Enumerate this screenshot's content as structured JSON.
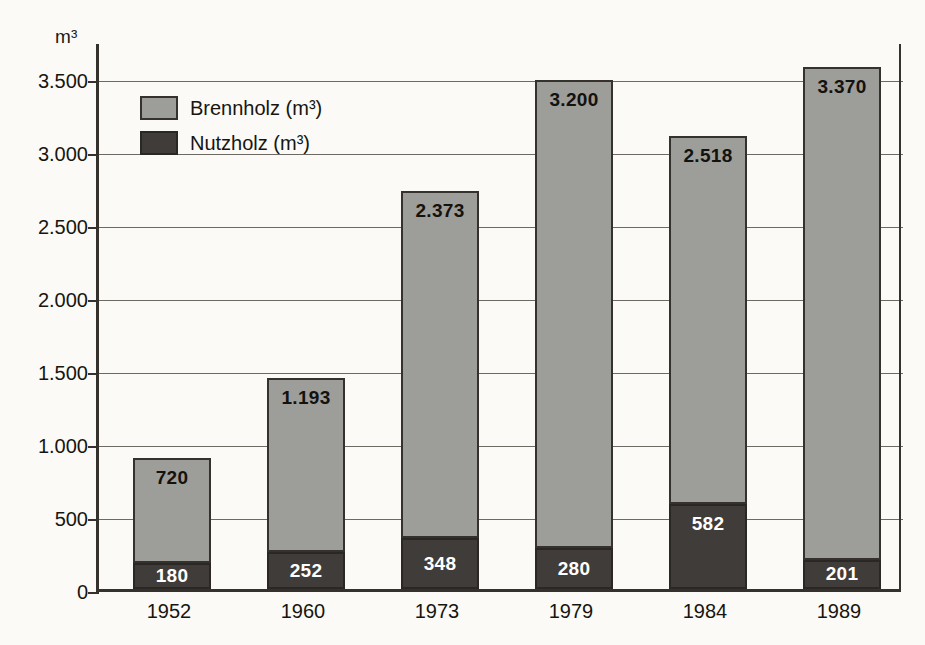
{
  "chart_data": {
    "type": "bar",
    "subtype": "stacked-bar",
    "title": "",
    "xlabel": "",
    "ylabel": "m³",
    "ylim": [
      0,
      3750
    ],
    "ytick_step": 500,
    "grid": true,
    "legend_position": "inside-top-left",
    "categories": [
      "1952",
      "1960",
      "1973",
      "1979",
      "1984",
      "1989"
    ],
    "ytick_labels": [
      "0",
      "500",
      "1.000",
      "1.500",
      "2.000",
      "2.500",
      "3.000",
      "3.500"
    ],
    "ytick_values": [
      0,
      500,
      1000,
      1500,
      2000,
      2500,
      3000,
      3500
    ],
    "series": [
      {
        "name": "Nutzholz (m³)",
        "color": "#403c39",
        "values": [
          180,
          252,
          348,
          280,
          582,
          201
        ],
        "labels": [
          "180",
          "252",
          "348",
          "280",
          "582",
          "201"
        ]
      },
      {
        "name": "Brennholz (m³)",
        "color": "#9d9d9a",
        "values": [
          720,
          1193,
          2373,
          3200,
          2518,
          3370
        ],
        "labels": [
          "720",
          "1.193",
          "2.373",
          "3.200",
          "2.518",
          "3.370"
        ]
      }
    ],
    "totals": [
      900,
      1445,
      2721,
      3480,
      3100,
      3571
    ]
  },
  "axis": {
    "unit_label": "m³"
  },
  "legend": {
    "items": [
      {
        "label": "Brennholz (m³)",
        "swatch": "light"
      },
      {
        "label": "Nutzholz (m³)",
        "swatch": "dark"
      }
    ]
  },
  "colors": {
    "light_bar": "#9d9d9a",
    "dark_bar": "#403c39",
    "axis": "#35312c",
    "grid": "#6d6a64",
    "background": "#fbfaf7"
  }
}
